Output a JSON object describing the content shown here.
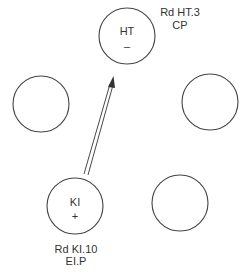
{
  "diagram": {
    "nodes": [
      {
        "id": "ht",
        "label": "HT",
        "sign": "–",
        "cx": 127,
        "cy": 36,
        "r": 28,
        "annotation": [
          "Rd HT.3",
          "CP"
        ]
      },
      {
        "id": "left",
        "label": "",
        "sign": "",
        "cx": 41,
        "cy": 104,
        "r": 28,
        "annotation": []
      },
      {
        "id": "right",
        "label": "",
        "sign": "",
        "cx": 210,
        "cy": 102,
        "r": 28,
        "annotation": []
      },
      {
        "id": "ki",
        "label": "KI",
        "sign": "+",
        "cx": 75,
        "cy": 206,
        "r": 28,
        "annotation": [
          "Rd KI.10",
          "EI.P"
        ]
      },
      {
        "id": "bottom-right",
        "label": "",
        "sign": "",
        "cx": 180,
        "cy": 203,
        "r": 28,
        "annotation": []
      }
    ],
    "arrows": [
      {
        "from": "ki",
        "to": "ht",
        "style": "double-line"
      }
    ],
    "colors": {
      "stroke": "#444444",
      "text": "#333333",
      "background": "#ffffff"
    }
  },
  "labels": {
    "ht_name": "HT",
    "ht_sign": "–",
    "ht_annotation_line1": "Rd HT.3",
    "ht_annotation_line2": "CP",
    "ki_name": "KI",
    "ki_sign": "+",
    "ki_annotation_line1": "Rd KI.10",
    "ki_annotation_line2": "EI.P"
  }
}
